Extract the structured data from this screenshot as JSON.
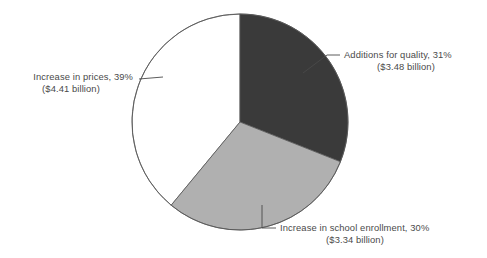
{
  "figure": {
    "background_color": "#ffffff",
    "width": 487,
    "height": 258
  },
  "chart_data": {
    "type": "pie",
    "title": "",
    "subtitle": "",
    "xlabel": "",
    "ylabel": "",
    "grid": false,
    "legend_position": "none",
    "label_style": "external-callout-with-leader-line",
    "start_angle_deg": 90,
    "direction": "clockwise",
    "center": {
      "x": 240,
      "y": 122
    },
    "radius": 108,
    "units": "billion USD",
    "categories": [
      "Additions for quality",
      "Increase in school enrollment",
      "Increase in prices"
    ],
    "values": [
      31,
      30,
      39
    ],
    "amounts": [
      3.48,
      3.34,
      4.41
    ],
    "slices": [
      {
        "name": "Additions for quality",
        "percent": 31,
        "percent_text": "31%",
        "amount": 3.48,
        "amount_text": "($3.48 billion)",
        "label_line1": "Additions for quality, 31%",
        "label_line2": "($3.48 billion)",
        "color": "#3a3a3a",
        "start_angle_deg": 0,
        "end_angle_deg": 111.6,
        "label_position": "right"
      },
      {
        "name": "Increase in school enrollment",
        "percent": 30,
        "percent_text": "30%",
        "amount": 3.34,
        "amount_text": "($3.34 billion)",
        "label_line1": "Increase in school enrollment, 30%",
        "label_line2": "($3.34 billion)",
        "color": "#b0b0b0",
        "start_angle_deg": 111.6,
        "end_angle_deg": 219.6,
        "label_position": "bottom"
      },
      {
        "name": "Increase in prices",
        "percent": 39,
        "percent_text": "39%",
        "amount": 4.41,
        "amount_text": "($4.41 billion)",
        "label_line1": "Increase in prices, 39%",
        "label_line2": "($4.41 billion)",
        "color": "#ffffff",
        "start_angle_deg": 219.6,
        "end_angle_deg": 360,
        "label_position": "left"
      }
    ],
    "total_percent": 100,
    "total_amount": 11.23
  },
  "labels": {
    "quality": {
      "line1": "Additions for quality, 31%",
      "line2": "($3.48 billion)"
    },
    "enrollment": {
      "line1": "Increase in school enrollment, 30%",
      "line2": "($3.34 billion)"
    },
    "prices": {
      "line1": "Increase in prices, 39%",
      "line2": "($4.41 billion)"
    }
  },
  "colors": {
    "dark_slice": "#3a3a3a",
    "gray_slice": "#b0b0b0",
    "white_slice": "#ffffff",
    "outline": "#555555",
    "text": "#4a4a4a",
    "background": "#ffffff"
  }
}
